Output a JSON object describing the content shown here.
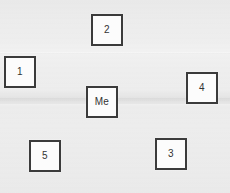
{
  "canvas": {
    "width": 230,
    "height": 193,
    "background_color": "#ececec",
    "description": "Photo backdrop with faint horizontal seams"
  },
  "style": {
    "node_fill": "#fcfcfc",
    "node_border_color": "#3b3b3b",
    "node_border_width": 2,
    "node_text_color": "#333333",
    "node_size": 32
  },
  "nodes": [
    {
      "id": "node-2",
      "label": "2",
      "x": 91,
      "y": 14,
      "width": 32,
      "height": 32
    },
    {
      "id": "node-1",
      "label": "1",
      "x": 4,
      "y": 56,
      "width": 32,
      "height": 32
    },
    {
      "id": "node-4",
      "label": "4",
      "x": 186,
      "y": 72,
      "width": 32,
      "height": 32
    },
    {
      "id": "node-me",
      "label": "Me",
      "x": 86,
      "y": 86,
      "width": 32,
      "height": 32
    },
    {
      "id": "node-3",
      "label": "3",
      "x": 155,
      "y": 138,
      "width": 32,
      "height": 32
    },
    {
      "id": "node-5",
      "label": "5",
      "x": 29,
      "y": 140,
      "width": 32,
      "height": 32
    }
  ]
}
